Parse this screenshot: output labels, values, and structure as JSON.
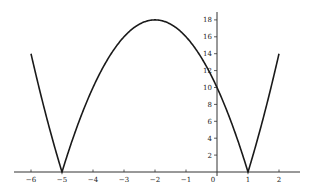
{
  "chart_data": {
    "type": "line",
    "title": "",
    "xlabel": "",
    "ylabel": "",
    "function": "y = |2x^2 + 8x - 10|",
    "xlim": [
      -6.5,
      2.6
    ],
    "ylim": [
      0,
      19
    ],
    "grid": false,
    "legend": null,
    "x_ticks": [
      -6,
      -5,
      -4,
      -3,
      -2,
      -1,
      0,
      1,
      2
    ],
    "x_tick_labels": [
      "−6",
      "−5",
      "−4",
      "−3",
      "−2",
      "−1",
      "0",
      "1",
      "2"
    ],
    "y_ticks": [
      2,
      4,
      6,
      8,
      10,
      12,
      14,
      16,
      18
    ],
    "y_tick_labels": [
      "2",
      "4",
      "6",
      "8",
      "10",
      "12",
      "14",
      "16",
      "18"
    ],
    "series": [
      {
        "name": "y",
        "color": "#1a1a1a",
        "x": [
          -6,
          -5.5,
          -5,
          -4.5,
          -4,
          -3.5,
          -3,
          -2.5,
          -2,
          -1.5,
          -1,
          -0.5,
          0,
          0.5,
          1,
          1.5,
          2
        ],
        "y": [
          14,
          6.5,
          0,
          5.5,
          10,
          13.5,
          16,
          17.5,
          18,
          17.5,
          16,
          13.5,
          10,
          5.5,
          0,
          6.5,
          14
        ]
      }
    ],
    "key_points": [
      {
        "label": "root",
        "x": -5,
        "y": 0
      },
      {
        "label": "maximum",
        "x": -2,
        "y": 18
      },
      {
        "label": "y-intercept",
        "x": 0,
        "y": 10
      },
      {
        "label": "root",
        "x": 1,
        "y": 0
      }
    ]
  }
}
